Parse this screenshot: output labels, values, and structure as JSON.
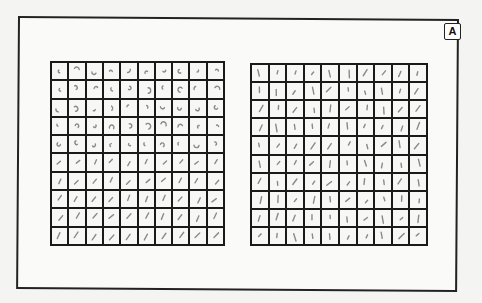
{
  "figure": {
    "panel_label": "A",
    "colors": {
      "frame": "#222222",
      "grid_lines": "#1a1a1a",
      "cell_bg": "#f7f7f5",
      "stroke": "#8a8a8a"
    },
    "grids": [
      {
        "name": "left-grid",
        "rows": 10,
        "cols": 10,
        "description": "Grid of small curved blob / arc glyph samples; upper rows show curled arcs and dots, lower rows short strokes"
      },
      {
        "name": "right-grid",
        "rows": 10,
        "cols": 10,
        "description": "Grid of small oriented line-segment glyph samples with varying slant"
      }
    ]
  }
}
